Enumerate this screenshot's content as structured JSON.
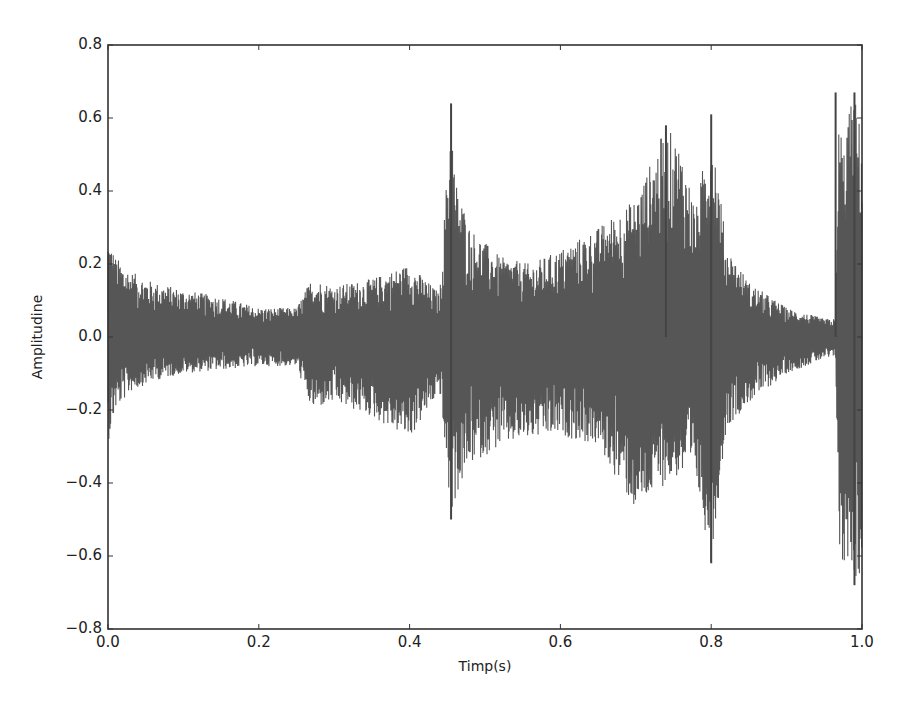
{
  "chart_data": {
    "type": "line",
    "title": "",
    "xlabel": "Timp(s)",
    "ylabel": "Amplitudine",
    "xlim": [
      0.0,
      1.0
    ],
    "ylim": [
      -0.8,
      0.8
    ],
    "grid": false,
    "legend": null,
    "xticks": [
      "0.0",
      "0.2",
      "0.4",
      "0.6",
      "0.8",
      "1.0"
    ],
    "yticks": [
      "0.8",
      "0.6",
      "0.4",
      "0.2",
      "0.0",
      "−0.2",
      "−0.4",
      "−0.6",
      "−0.8"
    ],
    "series": [
      {
        "name": "waveform",
        "color": "#444444",
        "description": "Audio waveform amplitude over 1 second; envelope (approx. peak values) sampled over time",
        "envelope": {
          "t": [
            0.0,
            0.01,
            0.03,
            0.06,
            0.1,
            0.15,
            0.2,
            0.25,
            0.27,
            0.3,
            0.35,
            0.4,
            0.44,
            0.455,
            0.46,
            0.48,
            0.52,
            0.56,
            0.6,
            0.65,
            0.7,
            0.74,
            0.76,
            0.78,
            0.8,
            0.82,
            0.85,
            0.9,
            0.95,
            0.965,
            0.97,
            0.975,
            0.98,
            0.99,
            1.0
          ],
          "upper": [
            0.28,
            0.22,
            0.18,
            0.15,
            0.13,
            0.11,
            0.08,
            0.08,
            0.16,
            0.14,
            0.16,
            0.2,
            0.12,
            0.64,
            0.44,
            0.3,
            0.22,
            0.2,
            0.24,
            0.3,
            0.38,
            0.58,
            0.52,
            0.35,
            0.61,
            0.25,
            0.15,
            0.08,
            0.05,
            0.05,
            0.67,
            0.5,
            0.6,
            0.67,
            0.55
          ],
          "lower": [
            -0.29,
            -0.2,
            -0.15,
            -0.12,
            -0.1,
            -0.09,
            -0.08,
            -0.08,
            -0.2,
            -0.18,
            -0.22,
            -0.28,
            -0.15,
            -0.5,
            -0.45,
            -0.35,
            -0.3,
            -0.28,
            -0.27,
            -0.3,
            -0.48,
            -0.4,
            -0.38,
            -0.4,
            -0.62,
            -0.25,
            -0.18,
            -0.1,
            -0.06,
            -0.06,
            -0.62,
            -0.66,
            -0.6,
            -0.66,
            -0.68
          ]
        },
        "notable_peaks": [
          {
            "t": 0.455,
            "value": 0.64
          },
          {
            "t": 0.455,
            "value": -0.5
          },
          {
            "t": 0.74,
            "value": 0.58
          },
          {
            "t": 0.8,
            "value": 0.61
          },
          {
            "t": 0.8,
            "value": -0.62
          },
          {
            "t": 0.965,
            "value": 0.67
          },
          {
            "t": 0.99,
            "value": 0.67
          },
          {
            "t": 0.99,
            "value": -0.68
          }
        ]
      }
    ]
  }
}
